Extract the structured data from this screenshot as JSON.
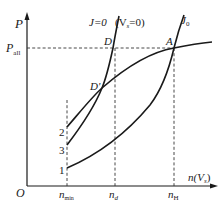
{
  "figure": {
    "type": "characteristic-curve-diagram",
    "axes": {
      "origin_label": "O",
      "y_label": "P",
      "x_label": "n(V",
      "x_label_sub": "s",
      "x_label_close": ")"
    },
    "reference_lines": {
      "p_level_label": "P",
      "p_level_sub": "all",
      "x_marks": [
        {
          "label": "n",
          "sub": "min"
        },
        {
          "label": "n",
          "sub": "d"
        },
        {
          "label": "n",
          "sub": "H"
        }
      ]
    },
    "curve_labels": {
      "j_zero": "J=0",
      "vs_zero": "(V",
      "vs_zero_sub": "s",
      "vs_zero_close": "=0)",
      "j0": "J",
      "j0_sub": "0"
    },
    "points": {
      "D": "D",
      "D_prime": "D'",
      "A": "A"
    },
    "curve_numbers": [
      "2",
      "3",
      "1"
    ],
    "colors": {
      "line": "#1a1a1a",
      "dashed": "#333333",
      "background": "#ffffff"
    }
  }
}
